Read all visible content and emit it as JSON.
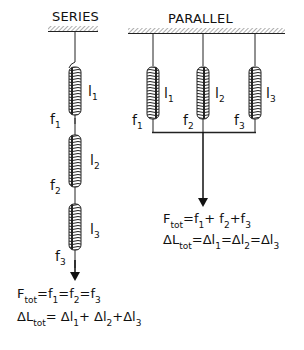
{
  "series": {
    "title": "SERIES",
    "springs": [
      {
        "length_label": "l",
        "length_sub": "1",
        "force_label": "f",
        "force_sub": "1"
      },
      {
        "length_label": "l",
        "length_sub": "2",
        "force_label": "f",
        "force_sub": "2"
      },
      {
        "length_label": "l",
        "length_sub": "3",
        "force_label": "f",
        "force_sub": "3"
      }
    ],
    "equation1": {
      "lhs": "F",
      "lhs_sub": "tot",
      "rhs": [
        "f",
        "1",
        "f",
        "2",
        "f",
        "3"
      ],
      "ops": [
        "=",
        "=",
        "="
      ]
    },
    "equation2": {
      "lhs": "ΔL",
      "lhs_sub": "tot",
      "terms": [
        "Δl",
        "1",
        "Δl",
        "2",
        "Δl",
        "3"
      ],
      "ops": [
        "=",
        "+",
        "+"
      ]
    }
  },
  "parallel": {
    "title": "PARALLEL",
    "springs": [
      {
        "length_label": "l",
        "length_sub": "1",
        "force_label": "f",
        "force_sub": "1"
      },
      {
        "length_label": "l",
        "length_sub": "2",
        "force_label": "f",
        "force_sub": "2"
      },
      {
        "length_label": "l",
        "length_sub": "3",
        "force_label": "f",
        "force_sub": "3"
      }
    ],
    "equation1": {
      "lhs": "F",
      "lhs_sub": "tot",
      "terms": [
        "f",
        "1",
        "f",
        "2",
        "f",
        "3"
      ],
      "ops": [
        "=",
        "+",
        "+"
      ]
    },
    "equation2": {
      "lhs": "ΔL",
      "lhs_sub": "tot",
      "terms": [
        "Δl",
        "1",
        "Δl",
        "2",
        "Δl",
        "3"
      ],
      "ops": [
        "=",
        "=",
        "="
      ]
    }
  }
}
